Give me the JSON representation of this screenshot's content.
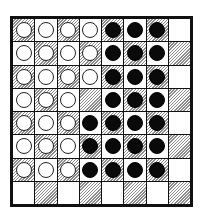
{
  "game": {
    "type": "reversi-board",
    "rows": 8,
    "cols": 8,
    "hatched_parity": "even",
    "board": [
      [
        "W",
        "W",
        "W",
        "W",
        "B",
        "B",
        "B",
        "."
      ],
      [
        "W",
        "W",
        "W",
        "W",
        "B",
        "B",
        "B",
        "."
      ],
      [
        "W",
        "W",
        "W",
        "W",
        "B",
        "B",
        "B",
        "."
      ],
      [
        "W",
        "W",
        "W",
        ".",
        "B",
        "B",
        "B",
        "."
      ],
      [
        "W",
        "W",
        "W",
        "B",
        "B",
        "B",
        "B",
        "."
      ],
      [
        "W",
        "W",
        "W",
        "B",
        "B",
        "B",
        "B",
        "."
      ],
      [
        "W",
        "W",
        "W",
        "B",
        "B",
        "B",
        "B",
        "."
      ],
      [
        ".",
        ".",
        ".",
        ".",
        ".",
        ".",
        ".",
        "."
      ]
    ],
    "counts": {
      "white": 27,
      "black": 24,
      "empty": 13
    },
    "colors": {
      "white_piece": "#ffffff",
      "black_piece": "#0a0a0a",
      "hatch": "#8a8a8a",
      "frame": "#111111"
    }
  }
}
